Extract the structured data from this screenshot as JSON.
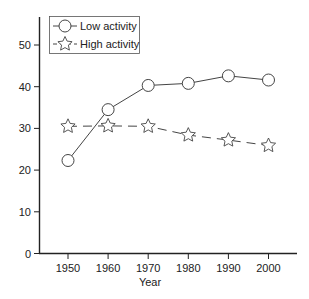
{
  "chart_data": {
    "type": "line",
    "title": "",
    "xlabel": "Year",
    "ylabel": "",
    "x": [
      1950,
      1960,
      1970,
      1980,
      1990,
      2000
    ],
    "x_tick_labels": [
      "1950",
      "1960",
      "1970",
      "1980",
      "1990",
      "2000"
    ],
    "y_ticks": [
      0,
      10,
      20,
      30,
      40,
      50
    ],
    "y_tick_labels": [
      "0",
      "10",
      "20",
      "30",
      "40",
      "50"
    ],
    "ylim": [
      0,
      55
    ],
    "grid": false,
    "legend_position": "upper-left",
    "series": [
      {
        "name": "Low activity",
        "marker": "open-circle",
        "line_style": "solid",
        "color": "#444444",
        "values": [
          22.3,
          34.5,
          40.3,
          40.8,
          42.6,
          41.6
        ]
      },
      {
        "name": "High activity",
        "marker": "open-star",
        "line_style": "dashed",
        "color": "#444444",
        "values": [
          30.5,
          30.6,
          30.5,
          28.4,
          27.2,
          25.9
        ]
      }
    ]
  }
}
